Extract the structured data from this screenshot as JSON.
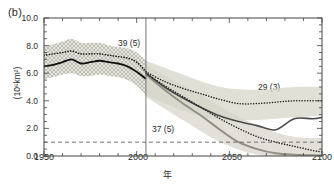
{
  "panel": {
    "label": "(b)"
  },
  "axes": {
    "y_label_prefix": "(10",
    "y_label_exp": "6",
    "y_label_suffix": "km",
    "y_label_exp2": "2",
    "y_label_close": ")",
    "y_label_full": "(10⁶km²)",
    "x_label": "年"
  },
  "annotations": [
    {
      "id": "historical-count",
      "text": "39 (5)",
      "x": 118,
      "y": 38
    },
    {
      "id": "lower-scenario-count",
      "text": "37 (5)",
      "x": 152,
      "y": 124
    },
    {
      "id": "upper-scenario-count",
      "text": "29 (3)",
      "x": 258,
      "y": 82
    }
  ],
  "chart_data": {
    "type": "line",
    "title": "",
    "xlabel": "年",
    "ylabel": "(10⁶km²)",
    "xlim": [
      1950,
      2100
    ],
    "ylim": [
      0.0,
      10.0
    ],
    "xticks": [
      1950,
      2000,
      2050,
      2100
    ],
    "xtick_labels": [
      "1950",
      "2000",
      "2050",
      "2100"
    ],
    "yticks": [
      0.0,
      2.0,
      4.0,
      6.0,
      8.0,
      10.0
    ],
    "ytick_labels": [
      "0.0",
      "2.0",
      "4.0",
      "6.0",
      "8.0",
      "10.0"
    ],
    "grid": false,
    "legend_position": "none",
    "reference_lines": [
      {
        "name": "ice-free-threshold",
        "orientation": "horizontal",
        "value": 1.0,
        "style": "dashed",
        "color": "#555555"
      },
      {
        "name": "historical-projection-divider",
        "orientation": "vertical",
        "value": 2005,
        "style": "solid",
        "color": "#555555"
      }
    ],
    "series": [
      {
        "name": "historical-solid",
        "style": "solid",
        "color": "#1a1a1a",
        "x": [
          1950,
          1955,
          1960,
          1965,
          1970,
          1975,
          1980,
          1985,
          1990,
          1995,
          2000,
          2005
        ],
        "values": [
          6.5,
          6.6,
          6.8,
          7.0,
          6.7,
          6.8,
          6.9,
          6.8,
          6.7,
          6.5,
          6.1,
          5.6
        ]
      },
      {
        "name": "historical-dotted",
        "style": "dotted",
        "color": "#1a1a1a",
        "x": [
          1950,
          1955,
          1960,
          1965,
          1970,
          1975,
          1980,
          1985,
          1990,
          1995,
          2000,
          2005
        ],
        "values": [
          7.3,
          7.4,
          7.5,
          7.6,
          7.4,
          7.4,
          7.4,
          7.3,
          7.2,
          7.1,
          6.8,
          6.1
        ]
      },
      {
        "name": "scenario-high-dotted",
        "style": "dotted",
        "color": "#1a1a1a",
        "x": [
          2005,
          2015,
          2025,
          2035,
          2045,
          2055,
          2065,
          2075,
          2085,
          2095,
          2100
        ],
        "values": [
          6.1,
          5.4,
          4.9,
          4.5,
          4.1,
          3.8,
          3.8,
          3.9,
          4.0,
          4.0,
          4.0
        ]
      },
      {
        "name": "scenario-high-solid",
        "style": "solid",
        "color": "#555555",
        "x": [
          2005,
          2015,
          2025,
          2035,
          2045,
          2055,
          2065,
          2075,
          2085,
          2095,
          2100
        ],
        "values": [
          6.0,
          5.0,
          4.2,
          3.5,
          2.9,
          2.5,
          2.2,
          1.9,
          2.7,
          2.7,
          2.8
        ]
      },
      {
        "name": "scenario-low-dotted",
        "style": "dotted",
        "color": "#1a1a1a",
        "x": [
          2005,
          2015,
          2025,
          2035,
          2045,
          2055,
          2065,
          2075,
          2085,
          2095,
          2100
        ],
        "values": [
          6.0,
          5.1,
          4.3,
          3.5,
          2.7,
          2.0,
          1.4,
          1.0,
          0.7,
          0.4,
          0.3
        ]
      },
      {
        "name": "scenario-low-solid",
        "style": "solid",
        "color": "#8a8a80",
        "x": [
          2005,
          2015,
          2025,
          2035,
          2045,
          2055,
          2065,
          2075,
          2085,
          2095,
          2100
        ],
        "values": [
          5.9,
          4.8,
          3.8,
          2.9,
          1.9,
          1.0,
          0.5,
          0.2,
          0.1,
          0.05,
          0.05
        ]
      }
    ],
    "bands": [
      {
        "name": "historical-uncertainty-band",
        "pattern": "crosshatch",
        "color": "#b9b9b0",
        "x": [
          1950,
          1955,
          1960,
          1965,
          1970,
          1975,
          1980,
          1985,
          1990,
          1995,
          2000,
          2005
        ],
        "upper": [
          7.9,
          8.1,
          8.3,
          8.5,
          8.2,
          8.2,
          8.2,
          8.0,
          7.9,
          7.8,
          7.5,
          6.9
        ],
        "lower": [
          5.6,
          5.7,
          5.9,
          6.0,
          5.8,
          5.8,
          5.9,
          5.8,
          5.7,
          5.5,
          5.1,
          4.4
        ]
      },
      {
        "name": "scenario-high-uncertainty-band",
        "pattern": "solid-fill",
        "color": "#d7d7cc",
        "x": [
          2005,
          2025,
          2045,
          2065,
          2085,
          2100
        ],
        "upper": [
          6.9,
          5.9,
          5.0,
          4.8,
          5.0,
          5.0
        ],
        "lower": [
          4.4,
          3.3,
          2.6,
          2.6,
          2.8,
          2.9
        ]
      },
      {
        "name": "scenario-low-uncertainty-band",
        "pattern": "solid-fill",
        "color": "#dedad0",
        "x": [
          2005,
          2025,
          2045,
          2065,
          2085,
          2100
        ],
        "upper": [
          6.6,
          5.1,
          3.6,
          2.2,
          1.4,
          1.3
        ],
        "lower": [
          4.3,
          2.6,
          1.0,
          0.1,
          0.0,
          0.0
        ]
      }
    ]
  }
}
